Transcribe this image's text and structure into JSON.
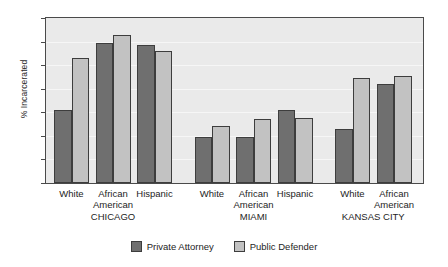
{
  "chart_data": {
    "type": "bar",
    "title": "",
    "xlabel": "",
    "ylabel": "% Incarcerated",
    "ylim": [
      0,
      70
    ],
    "yticks": [
      0,
      10,
      20,
      30,
      40,
      50,
      60,
      70
    ],
    "grid": true,
    "legend_position": "bottom-center",
    "categories": [
      "White",
      "African American",
      "Hispanic",
      "White",
      "African American",
      "Hispanic",
      "White",
      "African American"
    ],
    "groups": [
      {
        "city": "CHICAGO",
        "categories": [
          "White",
          "African American",
          "Hispanic"
        ]
      },
      {
        "city": "MIAMI",
        "categories": [
          "White",
          "African American",
          "Hispanic"
        ]
      },
      {
        "city": "KANSAS CITY",
        "categories": [
          "White",
          "African American"
        ]
      }
    ],
    "series": [
      {
        "name": "Private Attorney",
        "color": "#6f6f6f",
        "values": [
          31,
          59.5,
          58.5,
          19.5,
          19.5,
          31,
          23,
          42
        ]
      },
      {
        "name": "Public Defender",
        "color": "#c2c2c2",
        "values": [
          53,
          63,
          56,
          24,
          27,
          27.5,
          44.5,
          45.5
        ]
      }
    ]
  },
  "axis": {
    "y_title": "% Incarcerated",
    "y_tick_labels": [
      "0",
      "10",
      "20",
      "30",
      "40",
      "50",
      "60",
      "70"
    ]
  },
  "x_labels": [
    {
      "line1": "White",
      "line2": ""
    },
    {
      "line1": "African",
      "line2": "American"
    },
    {
      "line1": "Hispanic",
      "line2": ""
    },
    {
      "line1": "White",
      "line2": ""
    },
    {
      "line1": "African",
      "line2": "American"
    },
    {
      "line1": "Hispanic",
      "line2": ""
    },
    {
      "line1": "White",
      "line2": ""
    },
    {
      "line1": "African",
      "line2": "American"
    }
  ],
  "city_labels": [
    "CHICAGO",
    "MIAMI",
    "KANSAS CITY"
  ],
  "legend": [
    {
      "label": "Private Attorney",
      "swatch": "private"
    },
    {
      "label": "Public Defender",
      "swatch": "public"
    }
  ],
  "colors": {
    "private_attorney": "#6f6f6f",
    "public_defender": "#c2c2c2",
    "plot_background": "#eaeaea",
    "axis_line": "#4a4a4a",
    "gridline": "#f6f6f6"
  }
}
